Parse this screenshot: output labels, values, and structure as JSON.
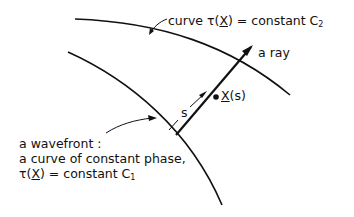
{
  "diagram": {
    "type": "wavefront-ray-geometry",
    "curves": [
      {
        "id": "curve-c2",
        "label": "curve τ(X) = constant C2"
      },
      {
        "id": "curve-c1",
        "label": "a wavefront: a curve of constant phase, τ(X) = constant C1"
      }
    ],
    "labels": {
      "c2": {
        "prefix": "curve ",
        "tau": "τ(",
        "x": "X",
        "rest": ") = constant C",
        "sub": "2"
      },
      "ray": "a ray",
      "point": {
        "x": "X",
        "rest": "(s)"
      },
      "s": "s",
      "wavefront": {
        "line1": "a wavefront :",
        "line2": "a curve of constant phase,",
        "line3": {
          "tau": "τ(",
          "x": "X",
          "rest": ") = constant  C",
          "sub": "1"
        }
      }
    },
    "stroke_color": "#111111",
    "background": "#ffffff"
  }
}
